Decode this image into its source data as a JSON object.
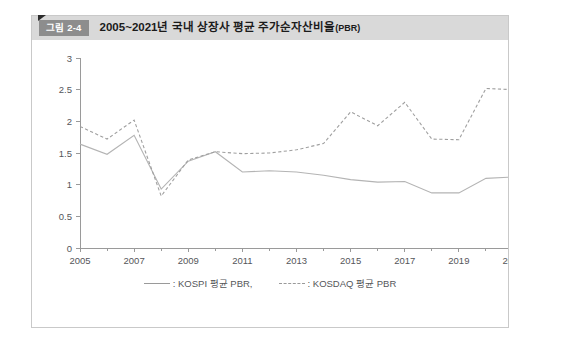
{
  "figure": {
    "badge": "그림 2-4",
    "title": "2005~2021년 국내 상장사 평균 주가순자산비율",
    "title_unit": "(PBR)"
  },
  "legend": {
    "items": [
      {
        "name": "kospi-legend",
        "label": ": KOSPI 평균 PBR,",
        "style": "solid"
      },
      {
        "name": "kosdaq-legend",
        "label": ": KOSDAQ 평균 PBR",
        "style": "dashed"
      }
    ]
  },
  "colors": {
    "header_bg": "#d9d9d9",
    "badge_bg": "#8d8d8d",
    "frame_border": "#c9c9c9",
    "axis": "#9a9a9a",
    "kospi_line": "#b4b4b4",
    "kosdaq_line": "#9f9f9f",
    "label_text": "#55565a"
  },
  "chart_data": {
    "type": "line",
    "title": "2005~2021년 국내 상장사 평균 주가순자산비율(PBR)",
    "xlabel": "",
    "ylabel": "",
    "x": [
      2005,
      2006,
      2007,
      2008,
      2009,
      2010,
      2011,
      2012,
      2013,
      2014,
      2015,
      2016,
      2017,
      2018,
      2019,
      2020,
      2021
    ],
    "xlim": [
      2005,
      2021
    ],
    "ylim": [
      0,
      3
    ],
    "yticks": [
      0,
      0.5,
      1,
      1.5,
      2,
      2.5,
      3
    ],
    "ytick_labels": [
      "0",
      "0.5",
      "1",
      "1.5",
      "2",
      "2.5",
      "3"
    ],
    "xticks": [
      2005,
      2007,
      2009,
      2011,
      2013,
      2015,
      2017,
      2019,
      2021
    ],
    "xtick_labels": [
      "2005",
      "2007",
      "2009",
      "2011",
      "2013",
      "2015",
      "2017",
      "2019",
      "2021"
    ],
    "xminor_ticks": [
      2006,
      2008,
      2010,
      2012,
      2014,
      2016,
      2018,
      2020
    ],
    "grid": false,
    "legend_position": "bottom",
    "series": [
      {
        "name": "KOSPI 평균 PBR",
        "style": "solid",
        "color": "#b4b4b4",
        "values": [
          1.64,
          1.48,
          1.78,
          0.93,
          1.37,
          1.52,
          1.2,
          1.22,
          1.2,
          1.15,
          1.08,
          1.04,
          1.05,
          0.87,
          0.87,
          1.1,
          1.12
        ]
      },
      {
        "name": "KOSDAQ 평균 PBR",
        "style": "dashed",
        "color": "#9f9f9f",
        "values": [
          1.92,
          1.72,
          2.02,
          0.82,
          1.39,
          1.52,
          1.49,
          1.5,
          1.55,
          1.65,
          2.15,
          1.93,
          2.3,
          1.72,
          1.71,
          2.52,
          2.5
        ]
      }
    ]
  }
}
